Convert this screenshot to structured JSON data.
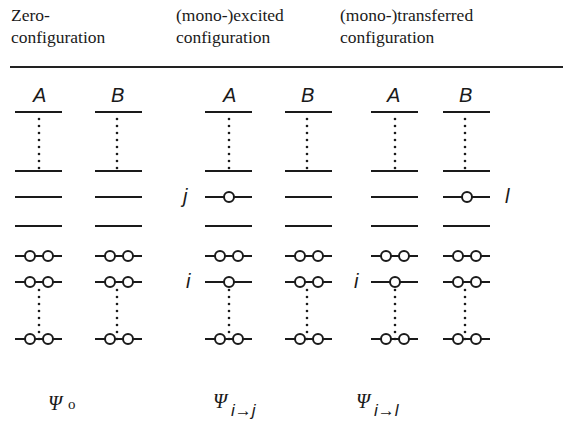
{
  "headers": [
    {
      "line1": "Zero-",
      "line2": "configuration"
    },
    {
      "line1": "(mono-)excited",
      "line2": "configuration"
    },
    {
      "line1": "(mono-)transferred",
      "line2": "configuration"
    }
  ],
  "molecule_labels": {
    "a": "A",
    "b": "B"
  },
  "orbital_labels": {
    "i": "i",
    "j": "j",
    "l": "l"
  },
  "configurations": [
    {
      "name": "zero",
      "symbol": "Ψ",
      "subscript": "o",
      "columns": [
        {
          "molecule": "A",
          "occupied": [
            2,
            2,
            2
          ],
          "virtual": [
            0,
            0,
            0,
            0
          ]
        },
        {
          "molecule": "B",
          "occupied": [
            2,
            2,
            2
          ],
          "virtual": [
            0,
            0,
            0,
            0
          ]
        }
      ]
    },
    {
      "name": "excited",
      "symbol": "Ψ",
      "subscript": "i→j",
      "columns": [
        {
          "molecule": "A",
          "occupied": [
            2,
            1,
            2
          ],
          "virtual": [
            0,
            0,
            1,
            0
          ]
        },
        {
          "molecule": "B",
          "occupied": [
            2,
            2,
            2
          ],
          "virtual": [
            0,
            0,
            0,
            0
          ]
        }
      ]
    },
    {
      "name": "transferred",
      "symbol": "Ψ",
      "subscript": "i→l",
      "columns": [
        {
          "molecule": "A",
          "occupied": [
            2,
            1,
            2
          ],
          "virtual": [
            0,
            0,
            0,
            0
          ]
        },
        {
          "molecule": "B",
          "occupied": [
            2,
            2,
            2
          ],
          "virtual": [
            0,
            0,
            1,
            0
          ]
        }
      ]
    }
  ],
  "wavefunctions": {
    "zero": {
      "symbol": "Ψ",
      "sub": "o"
    },
    "excited": {
      "symbol": "Ψ",
      "sub": "i→j"
    },
    "transferred": {
      "symbol": "Ψ",
      "sub": "i→l"
    }
  },
  "colors": {
    "ink": "#1a1a1a",
    "background": "#ffffff"
  }
}
